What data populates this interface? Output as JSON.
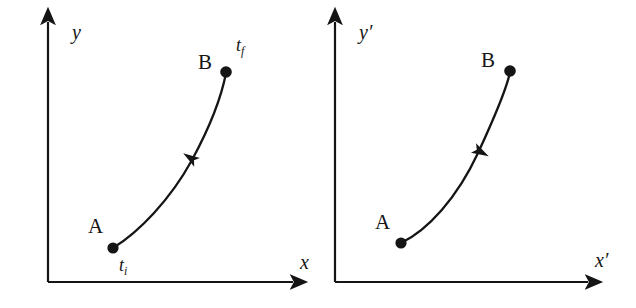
{
  "figure": {
    "background_color": "#ffffff",
    "ink_color": "#151515",
    "stroke_width": 2.2
  },
  "panels": [
    {
      "id": "unprimed-frame",
      "axes": {
        "x_label": "x",
        "y_label": "y",
        "origin": {
          "x": 48,
          "y": 282
        },
        "x_axis_tip": {
          "x": 300,
          "y": 282
        },
        "y_axis_tip": {
          "x": 48,
          "y": 15
        }
      },
      "points": [
        {
          "id": "point-a",
          "label": "A",
          "time_label": "t",
          "time_subscript": "i",
          "x": 113,
          "y": 248,
          "label_pos": {
            "x": 88,
            "y": 216
          },
          "time_pos": {
            "x": 119,
            "y": 256
          }
        },
        {
          "id": "point-b",
          "label": "B",
          "time_label": "t",
          "time_subscript": "f",
          "x": 226,
          "y": 72,
          "label_pos": {
            "x": 198,
            "y": 52
          },
          "time_pos": {
            "x": 236,
            "y": 36
          }
        }
      ],
      "trajectory": {
        "direction": "forward",
        "direction_description": "arrow points from A toward B",
        "arrow_position": {
          "x": 192,
          "y": 159
        },
        "arrow_angle_deg": -57,
        "path": "M 113 248 C 139 232, 170 200, 192 160 C 212 123, 222 94, 226 73"
      }
    },
    {
      "id": "primed-frame",
      "axes": {
        "x_label": "x′",
        "y_label": "y′",
        "origin": {
          "x": 17,
          "y": 282
        },
        "x_axis_tip": {
          "x": 277,
          "y": 282
        },
        "y_axis_tip": {
          "x": 17,
          "y": 15
        }
      },
      "points": [
        {
          "id": "point-a",
          "label": "A",
          "time_label": "",
          "time_subscript": "",
          "x": 83,
          "y": 243,
          "label_pos": {
            "x": 57,
            "y": 212
          },
          "time_pos": null
        },
        {
          "id": "point-b",
          "label": "B",
          "time_label": "",
          "time_subscript": "",
          "x": 192,
          "y": 71,
          "label_pos": {
            "x": 163,
            "y": 50
          },
          "time_pos": null
        }
      ],
      "trajectory": {
        "direction": "reverse",
        "direction_description": "arrow points from B back toward A",
        "arrow_position": {
          "x": 160,
          "y": 152
        },
        "arrow_angle_deg": 118,
        "path": "M 83 243 C 110 230, 139 198, 160 153 C 178 114, 189 88, 192 72"
      }
    }
  ],
  "caption": {
    "visible": false,
    "text": ""
  }
}
